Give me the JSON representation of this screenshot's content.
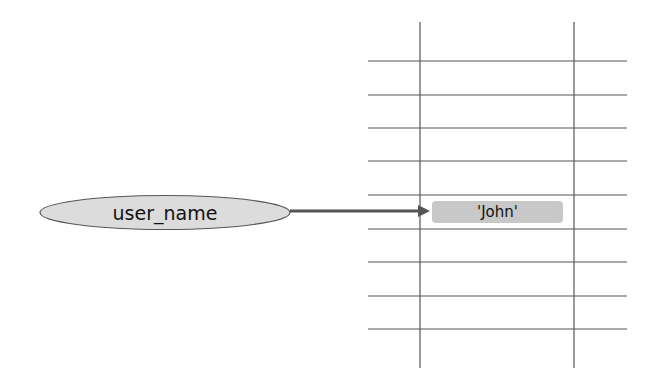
{
  "diagram": {
    "variable": {
      "name": "user_name",
      "fill": "#dcdcdc",
      "stroke": "#555555"
    },
    "value": {
      "text": "'John'",
      "fill": "#c8c8c8"
    },
    "arrow": {
      "color": "#555555"
    },
    "memory_grid": {
      "line_color": "#555555",
      "vertical_lines_x": [
        420,
        574
      ],
      "horizontal_lines_y": [
        61,
        95,
        128,
        161,
        195,
        229,
        262,
        296,
        329
      ]
    }
  }
}
